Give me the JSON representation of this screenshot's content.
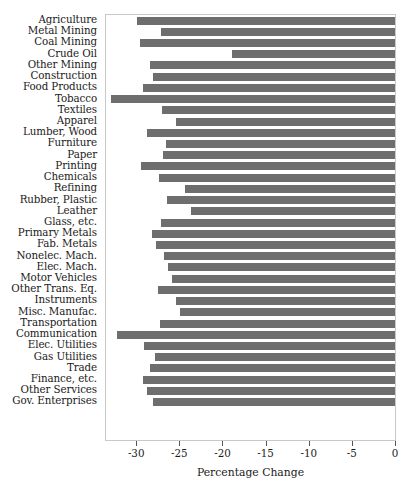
{
  "chart_data": {
    "type": "bar",
    "orientation": "horizontal",
    "title": "",
    "xlabel": "Percentage Change",
    "ylabel": "",
    "xlim": [
      -33.5,
      0
    ],
    "xticks": [
      -30,
      -25,
      -20,
      -15,
      -10,
      -5,
      0
    ],
    "xticklabels": [
      "-30",
      "-25",
      "-20",
      "-15",
      "-10",
      "-5",
      "0"
    ],
    "grid": false,
    "legend": null,
    "bar_color": "#6e6e6e",
    "categories": [
      "Agriculture",
      "Metal Mining",
      "Coal Mining",
      "Crude Oil",
      "Other Mining",
      "Construction",
      "Food Products",
      "Tobacco",
      "Textiles",
      "Apparel",
      "Lumber, Wood",
      "Furniture",
      "Paper",
      "Printing",
      "Chemicals",
      "Refining",
      "Rubber, Plastic",
      "Leather",
      "Glass, etc.",
      "Primary Metals",
      "Fab. Metals",
      "Nonelec. Mach.",
      "Elec. Mach.",
      "Motor Vehicles",
      "Other Trans. Eq.",
      "Instruments",
      "Misc. Manufac.",
      "Transportation",
      "Communication",
      "Elec. Utilities",
      "Gas Utilities",
      "Trade",
      "Finance, etc.",
      "Other Services",
      "Gov. Enterprises"
    ],
    "values": [
      -29.9,
      -27.1,
      -29.6,
      -18.9,
      -28.4,
      -28.0,
      -29.2,
      -32.9,
      -27.0,
      -25.4,
      -28.7,
      -26.5,
      -26.9,
      -29.5,
      -27.3,
      -24.4,
      -26.4,
      -23.6,
      -27.1,
      -28.2,
      -27.7,
      -26.8,
      -26.3,
      -25.9,
      -27.5,
      -25.4,
      -24.9,
      -27.2,
      -32.2,
      -29.1,
      -27.8,
      -28.4,
      -29.2,
      -28.7,
      -28.0
    ]
  },
  "axis": {
    "x_title": "Percentage Change"
  }
}
